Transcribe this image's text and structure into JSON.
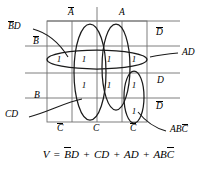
{
  "figure": {
    "type": "karnaugh-map",
    "title": "",
    "grid": {
      "rows": 4,
      "cols": 4
    },
    "axis_labels": {
      "top": [
        "A̅",
        "A"
      ],
      "left": [
        "B̅",
        "B"
      ],
      "bottom": [
        "C̅",
        "C",
        "C̅"
      ],
      "right": [
        "D̅",
        "D",
        "D̅"
      ]
    },
    "top": {
      "not_a": "A",
      "a": "A"
    },
    "left": {
      "not_b": "B",
      "b": "B"
    },
    "bottom": {
      "not_c1": "C",
      "c": "C",
      "not_c2": "C"
    },
    "right": {
      "not_d1": "D",
      "d": "D",
      "not_d2": "D"
    },
    "cells": [
      {
        "row": 1,
        "col": 1,
        "value": ""
      },
      {
        "row": 1,
        "col": 2,
        "value": ""
      },
      {
        "row": 1,
        "col": 3,
        "value": ""
      },
      {
        "row": 1,
        "col": 4,
        "value": ""
      },
      {
        "row": 2,
        "col": 1,
        "value": "1"
      },
      {
        "row": 2,
        "col": 2,
        "value": "1"
      },
      {
        "row": 2,
        "col": 3,
        "value": "1"
      },
      {
        "row": 2,
        "col": 4,
        "value": "1"
      },
      {
        "row": 3,
        "col": 1,
        "value": ""
      },
      {
        "row": 3,
        "col": 2,
        "value": "1"
      },
      {
        "row": 3,
        "col": 3,
        "value": "1"
      },
      {
        "row": 3,
        "col": 4,
        "value": "1"
      },
      {
        "row": 4,
        "col": 1,
        "value": ""
      },
      {
        "row": 4,
        "col": 2,
        "value": ""
      },
      {
        "row": 4,
        "col": 3,
        "value": ""
      },
      {
        "row": 4,
        "col": 4,
        "value": "1"
      }
    ],
    "ones": [
      "1",
      "1",
      "1",
      "1",
      "1",
      "1",
      "1",
      "1"
    ],
    "group_labels": {
      "bd": {
        "pre": "B",
        "post": "D"
      },
      "cd": "CD",
      "ad": "AD",
      "abc": {
        "pre": "AB",
        "post": "C"
      }
    },
    "equation": {
      "lhs": "V",
      "eq": "=",
      "t1_pre": "B",
      "t1_post": "D",
      "plus1": "+",
      "t2": "CD",
      "plus2": "+",
      "t3": "AD",
      "plus3": "+",
      "t4_pre": "AB",
      "t4_post": "C",
      "full_text": "V = B̅D + CD + AD + ABC̅"
    },
    "colors": {
      "ink": "#000000",
      "grid": "#6b6b6b",
      "background": "#ffffff"
    }
  }
}
